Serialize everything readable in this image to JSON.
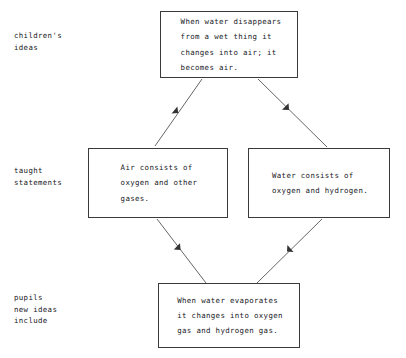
{
  "diagram": {
    "type": "flow-diagram",
    "background_color": "#ffffff",
    "line_color": "#3a3a3a",
    "text_color": "#20201f",
    "row_labels": [
      {
        "id": "childrens-ideas",
        "text": "children's\nideas"
      },
      {
        "id": "taught-statements",
        "text": "taught\nstatements"
      },
      {
        "id": "pupils-new-ideas",
        "text": "pupils\nnew ideas\ninclude"
      }
    ],
    "nodes": [
      {
        "id": "childrens-idea",
        "row": "childrens-ideas",
        "text": "When water disappears\nfrom a wet thing it\nchanges into air; it\nbecomes air."
      },
      {
        "id": "air-statement",
        "row": "taught-statements",
        "text": "Air consists of\noxygen and other\ngases."
      },
      {
        "id": "water-statement",
        "row": "taught-statements",
        "text": "Water consists of\noxygen and hydrogen."
      },
      {
        "id": "pupils-idea",
        "row": "pupils-new-ideas",
        "text": "When water evaporates\nit changes into oxygen\ngas and hydrogen gas."
      }
    ],
    "edges": [
      {
        "id": "edge-childrens-to-air",
        "from": "childrens-idea",
        "to": "air-statement",
        "direction": "down-left"
      },
      {
        "id": "edge-childrens-to-water",
        "from": "childrens-idea",
        "to": "water-statement",
        "direction": "down-right"
      },
      {
        "id": "edge-air-to-pupils",
        "from": "air-statement",
        "to": "pupils-idea",
        "direction": "down-right"
      },
      {
        "id": "edge-water-to-pupils",
        "from": "water-statement",
        "to": "pupils-idea",
        "direction": "down-left"
      }
    ]
  }
}
